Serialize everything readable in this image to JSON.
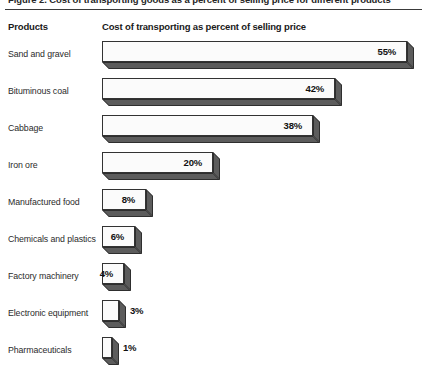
{
  "title": "Figure 2.  Cost of transporting goods as a percent of selling price for different products",
  "headers": {
    "products": "Products",
    "measure": "Cost of transporting as percent of selling price"
  },
  "colors": {
    "bar_face": "#fbfbfb",
    "bar_shadow": "#5c5c5c",
    "bar_outline": "#333333",
    "text": "#1a1a1a",
    "background": "#ffffff"
  },
  "chart_data": {
    "type": "bar",
    "orientation": "horizontal",
    "title": "Cost of transporting as percent of selling price",
    "xlabel": "Cost of transporting as percent of selling price",
    "ylabel": "Products",
    "xlim": [
      0,
      58
    ],
    "grid": false,
    "legend": null,
    "units": "percent",
    "value_suffix": "%",
    "categories": [
      "Sand and gravel",
      "Bituminous coal",
      "Cabbage",
      "Iron ore",
      "Manufactured food",
      "Chemicals and plastics",
      "Factory machinery",
      "Electronic equipment",
      "Pharmaceuticals"
    ],
    "values": [
      55,
      42,
      38,
      20,
      8,
      6,
      4,
      3,
      1
    ],
    "labels": [
      "55%",
      "42%",
      "38%",
      "20%",
      "8%",
      "6%",
      "4%",
      "3%",
      "1%"
    ],
    "label_placement": [
      "inside",
      "inside",
      "inside",
      "inside",
      "inside",
      "inside",
      "inside",
      "outside",
      "outside"
    ]
  }
}
